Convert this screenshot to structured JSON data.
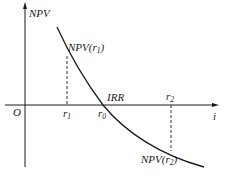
{
  "diagram": {
    "type": "npv-irr-curve",
    "y_axis_label": "NPV",
    "x_axis_label": "i",
    "origin_label": "O",
    "irr_label": "IRR",
    "points": {
      "r1": {
        "label": "r",
        "subscript": "1",
        "npv_label": "NPV(r",
        "npv_subscript": "1",
        "npv_close": ")"
      },
      "r0": {
        "label": "r",
        "subscript": "0"
      },
      "r2": {
        "label": "r",
        "subscript": "2",
        "npv_label": "NPV(r",
        "npv_subscript": "2",
        "npv_close": ")"
      }
    },
    "colors": {
      "stroke": "#1a1a1a",
      "background": "#ffffff"
    }
  }
}
